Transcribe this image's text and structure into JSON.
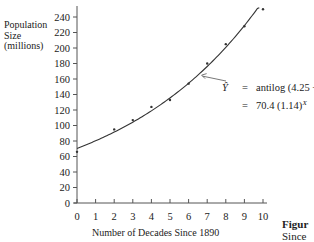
{
  "chart_data": {
    "type": "scatter",
    "title": "",
    "xlabel": "Number of Decades Since 1890",
    "ylabel": "Population Size (millions)",
    "ylabel_lines": [
      "Population",
      "Size",
      "(millions)"
    ],
    "xlim": [
      0,
      10
    ],
    "ylim": [
      0,
      250
    ],
    "x_ticks": [
      0,
      1,
      2,
      3,
      4,
      5,
      6,
      7,
      8,
      9,
      10
    ],
    "y_ticks": [
      0,
      20,
      40,
      60,
      80,
      100,
      120,
      140,
      160,
      180,
      200,
      220,
      240
    ],
    "grid": false,
    "series": [
      {
        "name": "Observed population",
        "kind": "points",
        "x": [
          0,
          2,
          3,
          4,
          5,
          6,
          7,
          8,
          9,
          10
        ],
        "y": [
          66,
          95,
          107,
          124,
          133,
          154,
          180,
          205,
          228,
          250
        ]
      },
      {
        "name": "Fitted exponential curve",
        "kind": "line",
        "equation": "Y = 70.4 (1.14)^X",
        "x": [
          0,
          1,
          2,
          3,
          4,
          5,
          6,
          7,
          8,
          9,
          10
        ],
        "y": [
          70.4,
          80.3,
          91.5,
          104.3,
          118.9,
          135.5,
          154.5,
          176.1,
          200.8,
          228.9,
          260.9
        ]
      }
    ],
    "annotations": [
      {
        "text_line1_lhs": "Ŷ",
        "text_line1_op": "=",
        "text_line1_rhs": "antilog (4.25 + .13X)",
        "text_line2_op": "=",
        "text_line2_rhs": "70.4 (1.14)^X",
        "arrow_to": [
          6.7,
          165
        ]
      }
    ]
  },
  "caption": {
    "bold": "Figur",
    "text": "Since"
  },
  "colors": {
    "axis": "#555555",
    "curve": "#333333",
    "point": "#333333",
    "text": "#222222"
  }
}
